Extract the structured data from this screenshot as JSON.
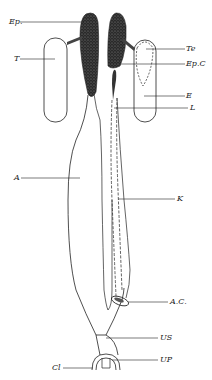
{
  "figure": {
    "labels": {
      "ep": "Ep.",
      "t": "T",
      "te": "Te",
      "epc": "Ep.C",
      "e": "E",
      "l": "L",
      "a": "A",
      "k": "K",
      "ac": "A.C.",
      "us": "US",
      "up": "UP",
      "cl": "Cl"
    },
    "colors": {
      "ink": "#222222",
      "background": "#ffffff"
    }
  }
}
